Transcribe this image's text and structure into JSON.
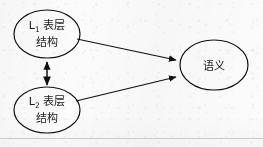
{
  "figure": {
    "kind": "diagram",
    "background_color": "#fbfbfb",
    "stroke_color": "#111111",
    "text_color": "#1a1a1a",
    "bottom_rule": true,
    "nodes": [
      {
        "id": "l1-surface-structure",
        "shape": "ellipse",
        "cx": 47,
        "cy": 34,
        "rx": 33,
        "ry": 24,
        "line1_main": "L",
        "line1_sub": "1",
        "line1_rest": " 表层",
        "line2": "结构"
      },
      {
        "id": "l2-surface-structure",
        "shape": "ellipse",
        "cx": 47,
        "cy": 110,
        "rx": 33,
        "ry": 23,
        "line1_main": "L",
        "line1_sub": "2",
        "line1_rest": " 表层",
        "line2": "结构"
      },
      {
        "id": "semantics",
        "shape": "ellipse",
        "cx": 214,
        "cy": 65,
        "rx": 34,
        "ry": 25,
        "line1_main": "语义",
        "line1_sub": "",
        "line1_rest": "",
        "line2": ""
      }
    ],
    "edges": [
      {
        "id": "l1-to-semantics",
        "from": "l1-surface-structure",
        "to": "semantics",
        "arrowheads": "end",
        "x1": 77,
        "y1": 39,
        "x2": 179,
        "y2": 61
      },
      {
        "id": "l2-to-semantics",
        "from": "l2-surface-structure",
        "to": "semantics",
        "arrowheads": "end",
        "x1": 76,
        "y1": 101,
        "x2": 179,
        "y2": 76
      },
      {
        "id": "l1-l2-bidirectional",
        "from": "l1-surface-structure",
        "to": "l2-surface-structure",
        "arrowheads": "both",
        "x1": 47,
        "y1": 60,
        "x2": 47,
        "y2": 86
      }
    ]
  }
}
